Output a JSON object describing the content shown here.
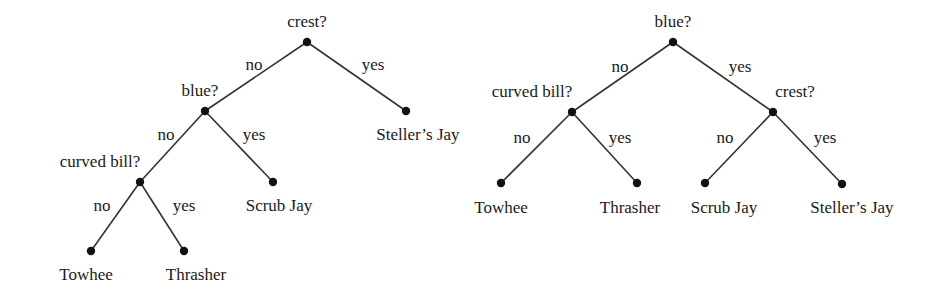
{
  "colors": {
    "line": "#333333",
    "node": "#111111",
    "text": "#1a1a1a",
    "background": "#ffffff"
  },
  "trees": [
    {
      "name": "tree-crest-first",
      "nodes": [
        {
          "id": "root",
          "x": 307,
          "y": 42,
          "label": "crest?",
          "lx": 307,
          "ly": 27,
          "anchor": "middle"
        },
        {
          "id": "blue",
          "x": 205,
          "y": 111,
          "label": "blue?",
          "lx": 200,
          "ly": 96,
          "anchor": "middle"
        },
        {
          "id": "curved",
          "x": 140,
          "y": 182,
          "label": "curved bill?",
          "lx": 100,
          "ly": 167,
          "anchor": "middle"
        },
        {
          "id": "towhee",
          "x": 91,
          "y": 251,
          "label": "Towhee",
          "lx": 86,
          "ly": 280,
          "anchor": "middle"
        },
        {
          "id": "thrasher",
          "x": 184,
          "y": 251,
          "label": "Thrasher",
          "lx": 196,
          "ly": 280,
          "anchor": "middle"
        },
        {
          "id": "scrub",
          "x": 273,
          "y": 182,
          "label": "Scrub Jay",
          "lx": 279,
          "ly": 211,
          "anchor": "middle"
        },
        {
          "id": "steller",
          "x": 406,
          "y": 111,
          "label": "Steller’s Jay",
          "lx": 418,
          "ly": 140,
          "anchor": "middle"
        }
      ],
      "edges": [
        {
          "from": "root",
          "to": "blue",
          "label": "no",
          "lx": 254,
          "ly": 70
        },
        {
          "from": "root",
          "to": "steller",
          "label": "yes",
          "lx": 373,
          "ly": 70
        },
        {
          "from": "blue",
          "to": "curved",
          "label": "no",
          "lx": 166,
          "ly": 140
        },
        {
          "from": "blue",
          "to": "scrub",
          "label": "yes",
          "lx": 254,
          "ly": 140
        },
        {
          "from": "curved",
          "to": "towhee",
          "label": "no",
          "lx": 102,
          "ly": 211
        },
        {
          "from": "curved",
          "to": "thrasher",
          "label": "yes",
          "lx": 184,
          "ly": 211
        }
      ]
    },
    {
      "name": "tree-blue-first",
      "nodes": [
        {
          "id": "root",
          "x": 673,
          "y": 42,
          "label": "blue?",
          "lx": 673,
          "ly": 27,
          "anchor": "middle"
        },
        {
          "id": "curved",
          "x": 572,
          "y": 112,
          "label": "curved bill?",
          "lx": 532,
          "ly": 97,
          "anchor": "middle"
        },
        {
          "id": "crest",
          "x": 773,
          "y": 112,
          "label": "crest?",
          "lx": 795,
          "ly": 97,
          "anchor": "middle"
        },
        {
          "id": "towhee",
          "x": 501,
          "y": 183,
          "label": "Towhee",
          "lx": 501,
          "ly": 213,
          "anchor": "middle"
        },
        {
          "id": "thrasher",
          "x": 637,
          "y": 183,
          "label": "Thrasher",
          "lx": 630,
          "ly": 213,
          "anchor": "middle"
        },
        {
          "id": "scrub",
          "x": 705,
          "y": 183,
          "label": "Scrub Jay",
          "lx": 724,
          "ly": 213,
          "anchor": "middle"
        },
        {
          "id": "steller",
          "x": 842,
          "y": 184,
          "label": "Steller’s Jay",
          "lx": 852,
          "ly": 213,
          "anchor": "middle"
        }
      ],
      "edges": [
        {
          "from": "root",
          "to": "curved",
          "label": "no",
          "lx": 620,
          "ly": 72
        },
        {
          "from": "root",
          "to": "crest",
          "label": "yes",
          "lx": 740,
          "ly": 72
        },
        {
          "from": "curved",
          "to": "towhee",
          "label": "no",
          "lx": 522,
          "ly": 143
        },
        {
          "from": "curved",
          "to": "thrasher",
          "label": "yes",
          "lx": 620,
          "ly": 143
        },
        {
          "from": "crest",
          "to": "scrub",
          "label": "no",
          "lx": 725,
          "ly": 143
        },
        {
          "from": "crest",
          "to": "steller",
          "label": "yes",
          "lx": 825,
          "ly": 143
        }
      ]
    }
  ]
}
